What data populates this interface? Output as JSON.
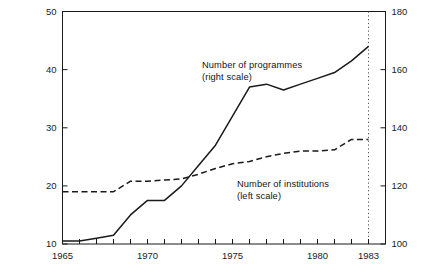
{
  "chart_data": {
    "type": "line",
    "title": "",
    "xlabel": "",
    "ylabel": "",
    "grid": false,
    "legend_position": "inline-annotation",
    "x": [
      1965,
      1966,
      1967,
      1968,
      1969,
      1970,
      1971,
      1972,
      1973,
      1974,
      1975,
      1976,
      1977,
      1978,
      1979,
      1980,
      1981,
      1982,
      1983
    ],
    "xlim": [
      1965,
      1984
    ],
    "xticks": [
      1965,
      1966,
      1967,
      1968,
      1969,
      1970,
      1971,
      1972,
      1973,
      1974,
      1975,
      1976,
      1977,
      1978,
      1979,
      1980,
      1981,
      1982,
      1983,
      1984
    ],
    "xtick_labels": [
      "1965",
      "1970",
      "1975",
      "1980",
      "1983"
    ],
    "xtick_label_values": [
      1965,
      1970,
      1975,
      1980,
      1983
    ],
    "left_axis": {
      "label": "Number of institutions (left scale)",
      "lim": [
        10,
        50
      ],
      "ticks": [
        10,
        20,
        30,
        40,
        50
      ],
      "tick_labels": [
        "10",
        "20",
        "30",
        "40",
        "50"
      ]
    },
    "right_axis": {
      "label": "Number of programmes (right scale)",
      "lim": [
        100,
        180
      ],
      "ticks": [
        100,
        120,
        140,
        160,
        180
      ],
      "tick_labels": [
        "100",
        "120",
        "140",
        "160",
        "180"
      ]
    },
    "annotations": [
      {
        "id": "programmes",
        "line1": "Number of programmes",
        "line2": "(right scale)"
      },
      {
        "id": "institutions",
        "line1": "Number of institutions",
        "line2": "(left scale)"
      }
    ],
    "vertical_marker": {
      "x": 1983,
      "style": "dotted"
    },
    "series": [
      {
        "name": "Number of programmes",
        "axis": "right",
        "style": "solid",
        "color": "#1a1a1a",
        "values": [
          101,
          101,
          102,
          103,
          110,
          115,
          115,
          120,
          127,
          134,
          144,
          154,
          155,
          153,
          155,
          157,
          159,
          163,
          168
        ]
      },
      {
        "name": "Number of institutions",
        "axis": "left",
        "style": "dashed",
        "color": "#1a1a1a",
        "values": [
          19.0,
          19.0,
          19.0,
          19.0,
          20.8,
          20.8,
          21.0,
          21.2,
          22.0,
          23.0,
          23.8,
          24.2,
          25.0,
          25.6,
          26.0,
          26.0,
          26.2,
          28.0,
          28.0
        ]
      }
    ]
  },
  "caption": ""
}
